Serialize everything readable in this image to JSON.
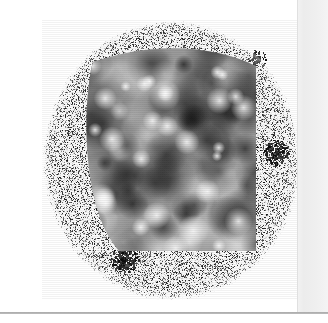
{
  "figure": {
    "title": "Solar disk speckle and supergranulation map",
    "background_color": "#ffffff",
    "width": 328,
    "height": 323
  },
  "disk": {
    "name": "solar-disk",
    "center_x": 171,
    "center_y": 160,
    "radius_x": 129,
    "radius_y": 140,
    "fill_description": "salt-and-pepper speckle noise",
    "speckle_color": "#1a1a1a",
    "base_color": "#fbfbfb",
    "speckle_density": 0.26
  },
  "inner_region": {
    "name": "smooth-blob-region",
    "left": 43,
    "top": 20,
    "right": 214,
    "bottom": 231,
    "description": "blurred grayscale supergranulation blobs",
    "blob_count": 150,
    "dark_color": "#141414",
    "light_color": "#f4f4f4"
  },
  "features": [
    {
      "name": "sunspot-cluster-east",
      "x": 234,
      "y": 132,
      "radius": 13,
      "intensity": 0.85
    },
    {
      "name": "sunspot-cluster-south",
      "x": 82,
      "y": 239,
      "radius": 14,
      "intensity": 0.9
    },
    {
      "name": "speckle-patch-northeast",
      "x": 215,
      "y": 38,
      "radius": 9,
      "intensity": 0.6
    }
  ],
  "panel": {
    "name": "right-occluding-panel",
    "left": 298,
    "width": 30,
    "color": "#f0f0f0",
    "edge_color": "#e0e0e0"
  },
  "rule": {
    "name": "bottom-rule",
    "top": 312,
    "color": "#9e9e9e"
  },
  "colors": {
    "background": "#ffffff",
    "speckle": "#1a1a1a",
    "panel": "#f0f0f0",
    "rule": "#9e9e9e"
  }
}
